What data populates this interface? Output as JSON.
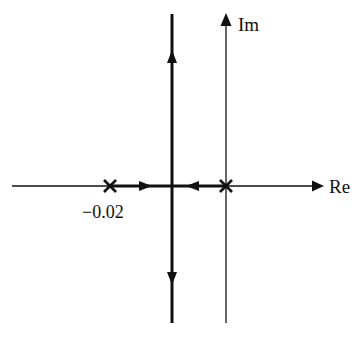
{
  "diagram": {
    "type": "root-locus",
    "axes": {
      "real_label": "Re",
      "imag_label": "Im"
    },
    "poles": [
      {
        "label": "-0.02",
        "position": -0.02,
        "marker": "x"
      },
      {
        "label": "",
        "position": 0,
        "marker": "x"
      }
    ],
    "branches": [
      {
        "description": "from pole at -0.02 toward breakaway point, arrow pointing right"
      },
      {
        "description": "from pole at origin toward breakaway point, arrow pointing left"
      },
      {
        "description": "vertical asymptote upward from breakaway point"
      },
      {
        "description": "vertical asymptote downward from breakaway point"
      }
    ],
    "colors": {
      "stroke": "#111111",
      "background": "#ffffff"
    }
  }
}
